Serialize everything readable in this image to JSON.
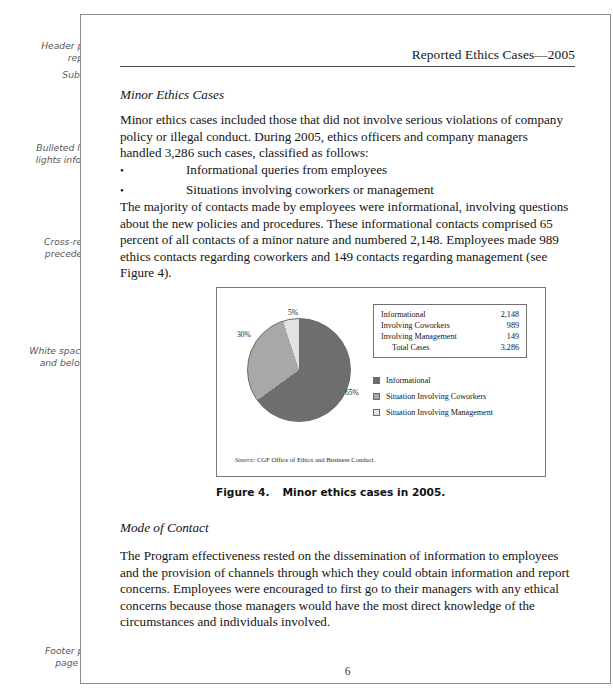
{
  "annotations": [
    {
      "id": "header-note",
      "text": "Header provides\nreport title"
    },
    {
      "id": "subhead-note",
      "text": "Subheading"
    },
    {
      "id": "bullet-note",
      "text": "Bulleted list high-\nlights information"
    },
    {
      "id": "xref-note",
      "text": "Cross-reference\nprecedes figure"
    },
    {
      "id": "space-note",
      "text": "White space above\nand below figure\nbox"
    },
    {
      "id": "footer-note",
      "text": "Footer provides\npage number"
    }
  ],
  "header": {
    "title": "Reported Ethics Cases—2005"
  },
  "sections": {
    "minor_heading": "Minor Ethics Cases",
    "mode_heading": "Mode of Contact"
  },
  "paragraphs": {
    "p1": "Minor ethics cases included those that did not involve serious violations of company policy or illegal conduct. During 2005, ethics officers and company managers handled 3,286 such cases, classified as follows:",
    "p2": "The majority of contacts made by employees were informational, involving questions about the new policies and procedures. These informational contacts comprised 65 percent of all contacts of a minor nature and numbered 2,148. Employees made 989 ethics contacts regarding coworkers and 149 contacts regarding management (see Figure 4).",
    "p3": "The Program effectiveness rested on the dissemination of information to employees and the provision of channels through which they could obtain information and report concerns. Employees were encouraged to first go to their managers with any ethical concerns because those managers would have the most direct knowledge of the circumstances and individuals involved."
  },
  "bullets": {
    "marker": "•",
    "items": [
      "Informational queries from employees",
      "Situations involving coworkers or management"
    ]
  },
  "figure": {
    "caption_number": "Figure 4.",
    "caption_text": "Minor ethics cases in 2005.",
    "source_label": "Source:",
    "source_text": "CGF Office of Ethics and Business Conduct.",
    "table": {
      "rows": [
        {
          "label": "Informational",
          "value": "2,148"
        },
        {
          "label": "Involving Coworkers",
          "value": "989"
        },
        {
          "label": "Involving Management",
          "value": "149"
        },
        {
          "label": "Total Cases",
          "value": "3,286"
        }
      ]
    }
  },
  "chart_data": {
    "type": "pie",
    "title": "Minor ethics cases in 2005",
    "categories": [
      "Informational",
      "Situation Involving Coworkers",
      "Situation Involving Management"
    ],
    "values": [
      65,
      30,
      5
    ],
    "counts": [
      2148,
      989,
      149
    ],
    "total": 3286,
    "value_labels": [
      "65%",
      "30%",
      "5%"
    ],
    "colors": [
      "#6e6e6e",
      "#a8a8a8",
      "#e2e2e2"
    ],
    "legend_position": "right",
    "start_angle_deg": 0,
    "direction": "clockwise",
    "grid": false
  },
  "footer": {
    "page_number": "6"
  }
}
